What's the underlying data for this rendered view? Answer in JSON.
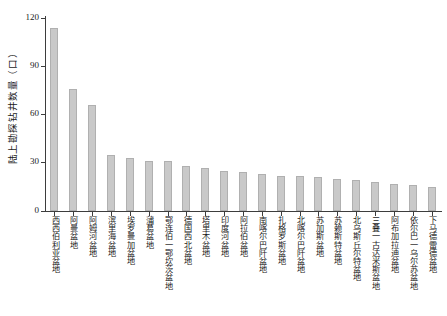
{
  "chart_data": {
    "type": "bar",
    "title": "",
    "subtitle": "",
    "xlabel": "",
    "ylabel": "陆上勘探钻井数量（口）",
    "ylim": [
      0,
      120
    ],
    "yticks": [
      0,
      30,
      60,
      90,
      120
    ],
    "ytick_labels": [
      "0",
      "30",
      "60",
      "90",
      "120"
    ],
    "grid": false,
    "legend": false,
    "bar_color": "#c9c9c9",
    "bar_edge_color": "#b0b0b0",
    "axis_color": "#3d3d3d",
    "categories": [
      "西西伯利亚盆地",
      "阿曼盆地",
      "阿姆河盆地",
      "滨里海盆地",
      "埃罗曼加盆地",
      "蒲葛盆地",
      "鄂连伯一鄂坎茨盆地",
      "德国西北盆地",
      "塔里木盆地",
      "印度河盆地",
      "阿拉伯盆地",
      "南喀尔巴阡盆地",
      "扎格罗斯盆地",
      "北喀尔巴阡盆地",
      "苏加斯盆地",
      "苏赖斯特盆地",
      "北乌斯丘尔特盆地",
      "三叠一古达米斯盆地",
      "阿布加拉迪盆地",
      "依尔巴一乌尔苏盆地",
      "下马德雷德盆地"
    ],
    "values": [
      114,
      76,
      66,
      35,
      33,
      31,
      31,
      28,
      27,
      25,
      24,
      23,
      22,
      22,
      21,
      20,
      19,
      18,
      17,
      16,
      15
    ]
  }
}
